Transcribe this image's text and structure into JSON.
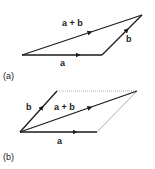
{
  "diagram_a": {
    "caption": "(a)",
    "labels": {
      "a": "a",
      "b": "b",
      "sum": "a + b"
    }
  },
  "diagram_b": {
    "caption": "(b)",
    "labels": {
      "a": "a",
      "b": "b",
      "sum": "a + b"
    }
  },
  "colors": {
    "vector": "#1a1a1a",
    "dotted": "#999999"
  }
}
